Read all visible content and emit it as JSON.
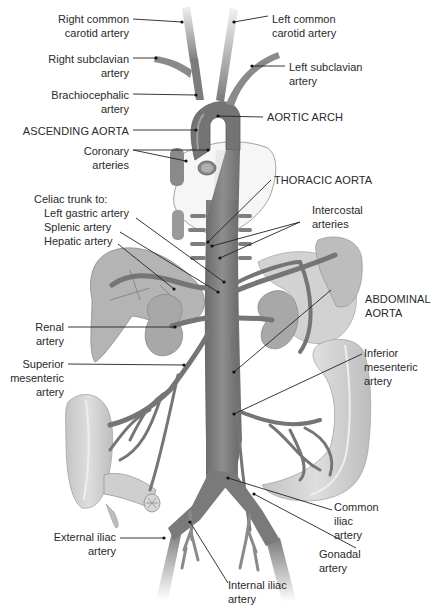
{
  "diagram": {
    "colors": {
      "vessel": "#7a7a7a",
      "vessel_light": "#9a9a9a",
      "organ": "#b8b8b8",
      "organ_light": "#d6d6d6",
      "heart": "#f4f4f4",
      "leader_line": "#222222",
      "background": "#ffffff"
    },
    "labels": {
      "right_common_carotid": [
        "Right common",
        "carotid artery"
      ],
      "left_common_carotid": [
        "Left common",
        "carotid artery"
      ],
      "right_subclavian": [
        "Right subclavian",
        "artery"
      ],
      "left_subclavian": [
        "Left subclavian",
        "artery"
      ],
      "brachiocephalic": [
        "Brachiocephalic",
        "artery"
      ],
      "aortic_arch": "AORTIC ARCH",
      "ascending_aorta": "ASCENDING AORTA",
      "coronary": [
        "Coronary",
        "arteries"
      ],
      "thoracic_aorta": "THORACIC AORTA",
      "celiac_trunk": "Celiac trunk to:",
      "left_gastric": "Left gastric artery",
      "splenic": "Splenic artery",
      "hepatic": "Hepatic artery",
      "intercostal": [
        "Intercostal",
        "arteries"
      ],
      "abdominal_aorta": [
        "ABDOMINAL",
        "AORTA"
      ],
      "renal": [
        "Renal",
        "artery"
      ],
      "superior_mesenteric": [
        "Superior",
        "mesenteric",
        "artery"
      ],
      "inferior_mesenteric": [
        "Inferior",
        "mesenteric",
        "artery"
      ],
      "common_iliac": [
        "Common",
        "iliac",
        "artery"
      ],
      "gonadal": [
        "Gonadal",
        "artery"
      ],
      "external_iliac": [
        "External iliac",
        "artery"
      ],
      "internal_iliac": [
        "Internal iliac",
        "artery"
      ]
    }
  }
}
